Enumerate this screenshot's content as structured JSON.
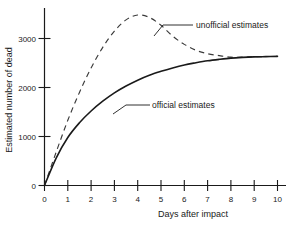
{
  "chart_data": {
    "type": "line",
    "title": "",
    "xlabel": "Days after impact",
    "ylabel": "Estimated number of dead",
    "xlim": [
      0,
      10
    ],
    "ylim": [
      0,
      3600
    ],
    "grid": false,
    "legend_position": "inline-annotations",
    "xticks": [
      "0",
      "1",
      "2",
      "3",
      "4",
      "5",
      "6",
      "7",
      "8",
      "9",
      "10"
    ],
    "yticks": [
      "0",
      "1000",
      "2000",
      "3000"
    ],
    "x": [
      0,
      0.5,
      1,
      1.5,
      2,
      2.5,
      3,
      3.5,
      4,
      4.5,
      5,
      5.5,
      6,
      6.5,
      7,
      7.5,
      8,
      8.5,
      9,
      9.5,
      10
    ],
    "series": [
      {
        "name": "official estimates",
        "style": "solid",
        "values": [
          0,
          560,
          980,
          1280,
          1520,
          1720,
          1890,
          2030,
          2150,
          2250,
          2330,
          2400,
          2460,
          2505,
          2545,
          2575,
          2600,
          2615,
          2625,
          2630,
          2635
        ]
      },
      {
        "name": "unofficial estimates",
        "style": "dashed",
        "values": [
          0,
          680,
          1330,
          1900,
          2400,
          2820,
          3150,
          3380,
          3480,
          3430,
          3270,
          3050,
          2880,
          2760,
          2690,
          2650,
          2620,
          2620,
          2628,
          2632,
          2635
        ]
      }
    ],
    "annotations": [
      {
        "id": "unofficial-annotation",
        "label": "unofficial estimates",
        "x": 7.5,
        "y": 3350
      },
      {
        "id": "official-annotation",
        "label": "official estimates",
        "x": 5.2,
        "y": 1810
      }
    ]
  },
  "axes": {
    "y_title": "Estimated number of dead",
    "x_title": "Days after impact",
    "y_tick_labels": [
      "3000",
      "2000",
      "1000",
      "0"
    ],
    "x_tick_labels": [
      "0",
      "1",
      "2",
      "3",
      "4",
      "5",
      "6",
      "7",
      "8",
      "9",
      "10"
    ]
  },
  "labels": {
    "unofficial": "unofficial estimates",
    "official": "official estimates"
  },
  "colors": {
    "ink": "#1a1a1a",
    "dashed_ink": "#3a3a3a",
    "background": "#ffffff"
  }
}
